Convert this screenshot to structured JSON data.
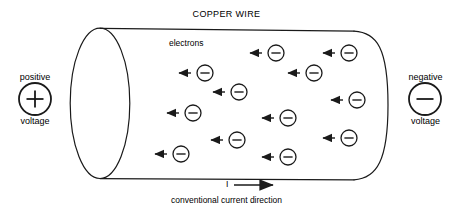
{
  "diagram": {
    "title": "COPPER WIRE",
    "electrons_label": "electrons",
    "current_symbol": "I",
    "caption": "conventional current direction",
    "stroke_color": "#1a1a1a",
    "background_color": "#ffffff",
    "terminals": {
      "positive": {
        "top_label": "positive",
        "bottom_label": "voltage",
        "sign": "+",
        "icon": "plus-circle-icon",
        "cx": 35,
        "cy": 99,
        "r": 16
      },
      "negative": {
        "top_label": "negative",
        "bottom_label": "voltage",
        "sign": "−",
        "icon": "minus-circle-icon",
        "cx": 425,
        "cy": 99,
        "r": 16
      }
    },
    "cylinder": {
      "left_ellipse": {
        "cx": 100,
        "cy": 103,
        "rx": 30,
        "ry": 75
      },
      "top_y": 29,
      "bottom_y": 179,
      "right_x": 388,
      "cap_rx": 34
    },
    "current_arrow": {
      "x1": 234,
      "y1": 185,
      "x2": 281,
      "y2": 185
    },
    "electrons": [
      {
        "cx": 276,
        "cy": 53,
        "arrow_from": 262,
        "arrow_to": 245
      },
      {
        "cx": 349,
        "cy": 53,
        "arrow_from": 335,
        "arrow_to": 318
      },
      {
        "cx": 205,
        "cy": 73,
        "arrow_from": 191,
        "arrow_to": 174
      },
      {
        "cx": 314,
        "cy": 73,
        "arrow_from": 300,
        "arrow_to": 283
      },
      {
        "cx": 239,
        "cy": 92,
        "arrow_from": 225,
        "arrow_to": 208
      },
      {
        "cx": 357,
        "cy": 100,
        "arrow_from": 343,
        "arrow_to": 326
      },
      {
        "cx": 193,
        "cy": 113,
        "arrow_from": 179,
        "arrow_to": 162
      },
      {
        "cx": 288,
        "cy": 118,
        "arrow_from": 274,
        "arrow_to": 257
      },
      {
        "cx": 237,
        "cy": 140,
        "arrow_from": 223,
        "arrow_to": 206
      },
      {
        "cx": 349,
        "cy": 138,
        "arrow_from": 335,
        "arrow_to": 318
      },
      {
        "cx": 181,
        "cy": 154,
        "arrow_from": 167,
        "arrow_to": 150
      },
      {
        "cx": 288,
        "cy": 157,
        "arrow_from": 274,
        "arrow_to": 257
      }
    ],
    "electron_radius": 8,
    "electron_symbol": "minus-sign"
  }
}
